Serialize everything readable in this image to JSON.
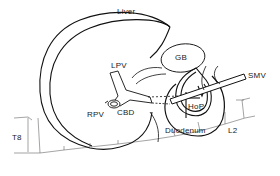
{
  "figure": {
    "type": "anatomical-diagram"
  },
  "labels": {
    "liver": "Liver",
    "gb": "GB",
    "lpv": "LPV",
    "rpv": "RPV",
    "cbd": "CBD",
    "hop": "HoP",
    "smv": "SMV",
    "duodenum": "Duodenum",
    "t8": "T8",
    "l2": "L2"
  },
  "colors": {
    "stroke": "#111111",
    "thin_stroke": "#555555",
    "background": "#ffffff"
  }
}
